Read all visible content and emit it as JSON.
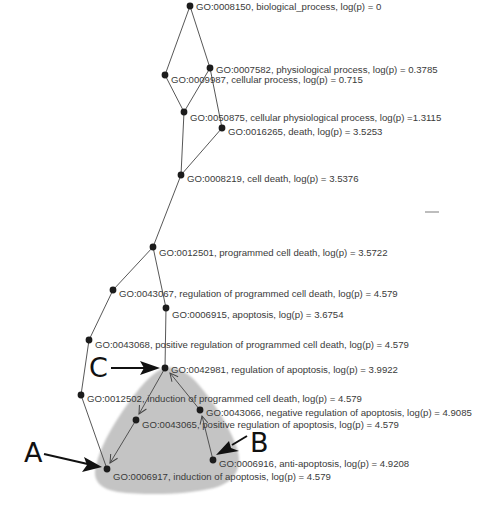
{
  "diagram": {
    "type": "GO term hierarchy graph",
    "colors": {
      "background": "#ffffff",
      "node": "#1c1c1c",
      "edge": "#444444",
      "label": "#3a3a3a",
      "highlight_region": "#c4c4c4",
      "callout": "#111111"
    },
    "nodes": [
      {
        "id": "GO:0008150",
        "label": "GO:0008150, biological_process, log(p) = 0",
        "x": 190,
        "y": 6
      },
      {
        "id": "GO:0007582",
        "label": "GO:0007582, physiological process, log(p) = 0.3785",
        "x": 210,
        "y": 68
      },
      {
        "id": "GO:0009987",
        "label": "GO:0009987, cellular process, log(p) = 0.715",
        "x": 165,
        "y": 75
      },
      {
        "id": "GO:0050875",
        "label": "GO:0050875, cellular physiological process, log(p) =1.3115",
        "x": 184,
        "y": 112
      },
      {
        "id": "GO:0016265",
        "label": "GO:0016265, death, log(p) = 3.5253",
        "x": 222,
        "y": 128
      },
      {
        "id": "GO:0008219",
        "label": "GO:0008219, cell death, log(p) = 3.5376",
        "x": 181,
        "y": 175
      },
      {
        "id": "GO:0012501",
        "label": "GO:0012501, programmed cell death, log(p) = 3.5722",
        "x": 153,
        "y": 247
      },
      {
        "id": "GO:0043067",
        "label": "GO:0043067, regulation of programmed cell death, log(p) = 4.579",
        "x": 113,
        "y": 290
      },
      {
        "id": "GO:0006915",
        "label": "GO:0006915, apoptosis, log(p) = 3.6754",
        "x": 166,
        "y": 308
      },
      {
        "id": "GO:0043068",
        "label": "GO:0043068, positive regulation of programmed cell death, log(p) = 4.579",
        "x": 89,
        "y": 340
      },
      {
        "id": "GO:0042981",
        "label": "GO:0042981, regulation of apoptosis, log(p) = 3.9922",
        "x": 165,
        "y": 368
      },
      {
        "id": "GO:0012502",
        "label": "GO:0012502, induction of programmed cell death, log(p) = 4.579",
        "x": 81,
        "y": 395
      },
      {
        "id": "GO:0043066",
        "label": "GO:0043066, negative regulation of apoptosis, log(p) = 4.9085",
        "x": 200,
        "y": 410
      },
      {
        "id": "GO:0043065",
        "label": "GO:0043065, positive regulation of apoptosis, log(p) = 4.579",
        "x": 136,
        "y": 420
      },
      {
        "id": "GO:0006916",
        "label": "GO:0006916, anti-apoptosis, log(p) = 4.9208",
        "x": 213,
        "y": 460
      },
      {
        "id": "GO:0006917",
        "label": "GO:0006917, induction of apoptosis, log(p) = 4.579",
        "x": 107,
        "y": 469
      }
    ],
    "edges": [
      [
        "GO:0008150",
        "GO:0007582"
      ],
      [
        "GO:0008150",
        "GO:0009987"
      ],
      [
        "GO:0009987",
        "GO:0050875"
      ],
      [
        "GO:0007582",
        "GO:0050875"
      ],
      [
        "GO:0007582",
        "GO:0016265"
      ],
      [
        "GO:0050875",
        "GO:0008219"
      ],
      [
        "GO:0016265",
        "GO:0008219"
      ],
      [
        "GO:0008219",
        "GO:0012501"
      ],
      [
        "GO:0012501",
        "GO:0043067"
      ],
      [
        "GO:0012501",
        "GO:0006915"
      ],
      [
        "GO:0043067",
        "GO:0043068"
      ],
      [
        "GO:0006915",
        "GO:0042981"
      ],
      [
        "GO:0043068",
        "GO:0012502"
      ],
      [
        "GO:0012502",
        "GO:0006917"
      ]
    ],
    "arrow_edges": [
      {
        "from": "GO:0042981",
        "to": "GO:0043065"
      },
      {
        "from": "GO:0043065",
        "to": "GO:0006917"
      },
      {
        "from": "GO:0043066",
        "to": "GO:0042981"
      },
      {
        "from": "GO:0006916",
        "to": "GO:0043066"
      }
    ],
    "callouts": [
      {
        "letter": "A",
        "target": "GO:0006917"
      },
      {
        "letter": "B",
        "target": "GO:0006916"
      },
      {
        "letter": "C",
        "target": "GO:0042981"
      }
    ]
  },
  "labels": {
    "n0": "GO:0008150, biological_process, log(p) = 0",
    "n1": "GO:0007582, physiological process, log(p) = 0.3785",
    "n2": "GO:0009987, cellular process, log(p) = 0.715",
    "n3": "GO:0050875, cellular physiological process, log(p) =1.3115",
    "n4": "GO:0016265, death, log(p) = 3.5253",
    "n5": "GO:0008219, cell death, log(p) = 3.5376",
    "n6": "GO:0012501, programmed cell death, log(p) = 3.5722",
    "n7": "GO:0043067, regulation of programmed cell death, log(p) = 4.579",
    "n8": "GO:0006915, apoptosis, log(p) = 3.6754",
    "n9": "GO:0043068, positive regulation of programmed cell death, log(p) = 4.579",
    "n10": "GO:0042981, regulation of apoptosis, log(p) = 3.9922",
    "n11": "GO:0012502, induction of programmed cell death, log(p) = 4.579",
    "n12": "GO:0043066, negative regulation of apoptosis, log(p) = 4.9085",
    "n13": "GO:0043065, positive regulation of apoptosis, log(p) = 4.579",
    "n14": "GO:0006916, anti-apoptosis, log(p) = 4.9208",
    "n15": "GO:0006917, induction of apoptosis, log(p) = 4.579"
  },
  "callout_letters": {
    "a": "A",
    "b": "B",
    "c": "C"
  }
}
